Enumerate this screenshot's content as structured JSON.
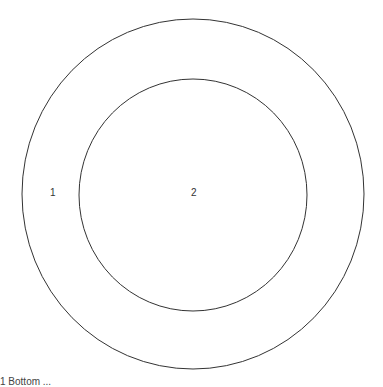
{
  "diagram": {
    "type": "concentric-circles",
    "stroke_color": "#333333",
    "background": "#ffffff",
    "outer_circle": {
      "label": "1",
      "cx": 193,
      "cy": 194,
      "rx": 171,
      "ry": 175
    },
    "inner_circle": {
      "label": "2",
      "cx": 193,
      "cy": 195,
      "rx": 114,
      "ry": 116
    }
  },
  "caption": "1 Bottom ..."
}
